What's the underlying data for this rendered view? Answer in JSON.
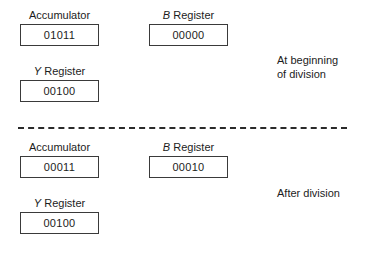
{
  "figure": {
    "panels": [
      {
        "id": "before",
        "caption": "At beginning\nof division",
        "registers": [
          {
            "id": "accumulator",
            "label": "Accumulator",
            "label_italic_prefix": "",
            "value": "01011"
          },
          {
            "id": "b-register",
            "label": "Register",
            "label_italic_prefix": "B",
            "value": "00000"
          },
          {
            "id": "y-register",
            "label": "Register",
            "label_italic_prefix": "Y",
            "value": "00100"
          }
        ]
      },
      {
        "id": "after",
        "caption": "After division",
        "registers": [
          {
            "id": "accumulator",
            "label": "Accumulator",
            "label_italic_prefix": "",
            "value": "00011"
          },
          {
            "id": "b-register",
            "label": "Register",
            "label_italic_prefix": "B",
            "value": "00010"
          },
          {
            "id": "y-register",
            "label": "Register",
            "label_italic_prefix": "Y",
            "value": "00100"
          }
        ]
      }
    ],
    "divider": {
      "style": "dashed"
    },
    "colors": {
      "background": "#ffffff",
      "text": "#1c1c1c",
      "box_border": "#3a3a3a",
      "divider": "#2a2a2a"
    }
  }
}
